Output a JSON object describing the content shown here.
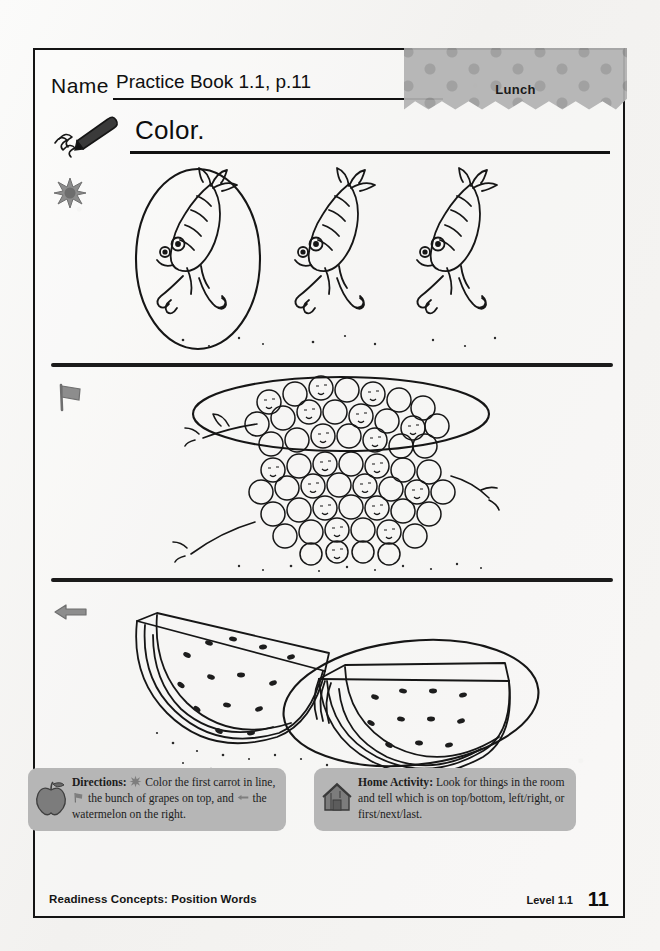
{
  "page": {
    "background_color": "#f4f3f1",
    "frame_color": "#141414"
  },
  "header": {
    "name_label": "Name",
    "name_value": "Practice Book 1.1, p.11",
    "theme_tab": {
      "label": "Lunch",
      "pattern": "polka-dots",
      "color": "#b2b2b2"
    }
  },
  "title": {
    "text": "Color.",
    "icon": "crayon-icon"
  },
  "rows": [
    {
      "marker_icon": "star-icon",
      "subject": "carrots",
      "item_count": 3,
      "circled_index": 1,
      "description": "Three cartoon running carrots with faces; the first one is circled."
    },
    {
      "marker_icon": "flag-icon",
      "subject": "grapes",
      "item_count": 2,
      "circled_index": 1,
      "description": "Two bunches of grapes, one on top of the other; the top bunch is circled."
    },
    {
      "marker_icon": "arrow-left-icon",
      "subject": "watermelon",
      "item_count": 2,
      "circled_index": 2,
      "description": "Two watermelon slices; the one on the right is circled."
    }
  ],
  "footer": {
    "directions": {
      "icon": "apple-icon",
      "label": "Directions:",
      "segment_1": "Color the first carrot in line,",
      "segment_2": "the bunch of grapes on top, and",
      "segment_3": "the watermelon on the right.",
      "symbol_1": "star-icon",
      "symbol_2": "flag-icon",
      "symbol_3": "arrow-left-icon"
    },
    "home_activity": {
      "icon": "house-icon",
      "label": "Home Activity:",
      "text": "Look for things in the room and tell which is on top/bottom, left/right, or first/next/last."
    },
    "strand": "Readiness Concepts: Position Words",
    "level": "Level 1.1",
    "page_number": "11"
  }
}
